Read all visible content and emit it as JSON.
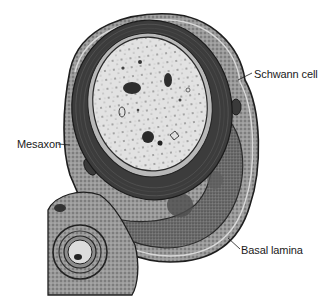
{
  "figure": {
    "labels": [
      {
        "id": "schwann",
        "text": "Schwann cell"
      },
      {
        "id": "mesaxon",
        "text": "Mesaxon"
      },
      {
        "id": "basal",
        "text": "Basal lamina"
      }
    ],
    "colors": {
      "background": "#ffffff",
      "axoplasm": "#e4e4e4",
      "myelin": "#3a3a3a",
      "cytoplasm": "#8a8a8a",
      "nucleus": "#5a5a5a",
      "outline": "#1e1e1e",
      "label_text": "#1a1a1a"
    }
  }
}
